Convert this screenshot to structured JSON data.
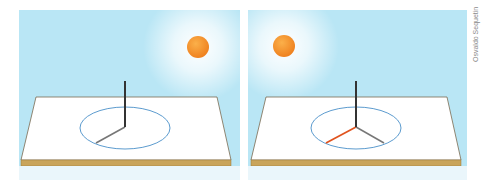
{
  "figure": {
    "colors": {
      "sky": "#b9e6f5",
      "sun": "#f39a2e",
      "board_top": "#ffffff",
      "board_edge": "#c9a45a",
      "circle": "#4a90c8",
      "gnomon": "#333333",
      "shadow": "#777777",
      "highlight_shadow": "#e0531e"
    },
    "panels": [
      {
        "id": "left",
        "sun_position": "upper-right",
        "shadows": [
          "toward lower-left"
        ]
      },
      {
        "id": "right",
        "sun_position": "upper-left",
        "shadows": [
          "toward lower-left (highlighted red, earlier)",
          "toward lower-right (current)"
        ]
      }
    ],
    "credit": "Osvaldo Sequetin"
  }
}
